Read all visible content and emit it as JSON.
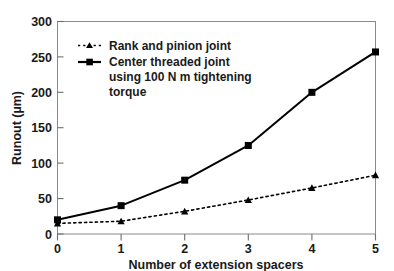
{
  "chart_data": {
    "type": "line",
    "title": "",
    "xlabel": "Number of extension spacers",
    "ylabel": "Runout (µm)",
    "x": [
      0,
      1,
      2,
      3,
      4,
      5
    ],
    "xlim": [
      0,
      5
    ],
    "ylim": [
      0,
      300
    ],
    "xticks": [
      "0",
      "1",
      "2",
      "3",
      "4",
      "5"
    ],
    "yticks": [
      "0",
      "50",
      "100",
      "150",
      "200",
      "250",
      "300"
    ],
    "grid": false,
    "legend_position": "upper-left-inside",
    "series": [
      {
        "name": "Rank and pinion joint",
        "marker": "triangle",
        "line_style": "dotted",
        "color": "#000000",
        "values": [
          15,
          18,
          32,
          48,
          65,
          83
        ]
      },
      {
        "name": "Center threaded joint using 100 N m tightening torque",
        "marker": "square",
        "line_style": "solid",
        "color": "#000000",
        "values": [
          20,
          40,
          76,
          125,
          200,
          257
        ]
      }
    ]
  },
  "legend": {
    "entries": [
      {
        "label": "Rank and pinion joint"
      },
      {
        "label_line1": "Center threaded joint"
      },
      {
        "label_line2": "using 100 N m tightening"
      },
      {
        "label_line3": "torque"
      }
    ]
  },
  "axes": {
    "y_title": "Runout (µm)",
    "x_title": "Number of extension spacers",
    "y_tick_0": "0",
    "y_tick_1": "50",
    "y_tick_2": "100",
    "y_tick_3": "150",
    "y_tick_4": "200",
    "y_tick_5": "250",
    "y_tick_6": "300",
    "x_tick_0": "0",
    "x_tick_1": "1",
    "x_tick_2": "2",
    "x_tick_3": "3",
    "x_tick_4": "4",
    "x_tick_5": "5"
  },
  "colors": {
    "axis": "#6e6e6e",
    "series": "#000000",
    "background": "#ffffff",
    "text": "#1a1a1a"
  }
}
